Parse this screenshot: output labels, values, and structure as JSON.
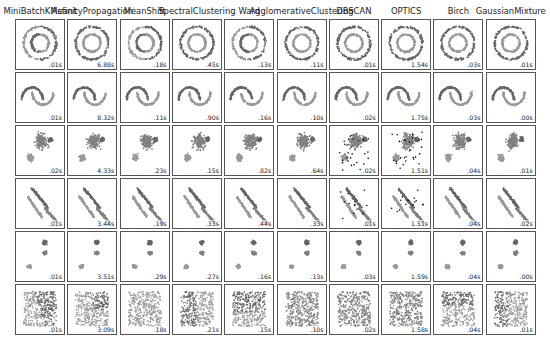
{
  "chart_data": {
    "type": "scatter",
    "layout": {
      "rows": 6,
      "cols": 10,
      "grid": false,
      "axes_ticks": false
    },
    "algorithms": [
      "MiniBatchKMeant",
      "AsfinityPropagation",
      "MeanShift",
      "SpectralClustering",
      "Ward",
      "AgglomerativeClustering",
      "DBSCAN",
      "OPTICS",
      "Birch",
      "GaussianMixture"
    ],
    "datasets": [
      "noisy_circles",
      "noisy_moons",
      "varied_blobs",
      "anisotropic_blobs",
      "blobs",
      "no_structure"
    ],
    "timings": [
      [
        ".01s",
        "6.88s",
        ".18s",
        ".45s",
        ".13s",
        ".11s",
        ".01s",
        "1.54s",
        ".03s",
        ".01s"
      ],
      [
        ".01s",
        "8.32s",
        ".11s",
        ".90s",
        ".16s",
        ".10s",
        ".02s",
        "1.75s",
        ".03s",
        ".00s"
      ],
      [
        ".02s",
        "4.33s",
        ".23s",
        ".15s",
        ".82s",
        ".64s",
        ".02s",
        "1.51s",
        ".04s",
        ".01s"
      ],
      [
        ".01s",
        "3.44s",
        ".19s",
        ".33s",
        ".44s",
        ".33s",
        ".01s",
        "1.51s",
        ".04s",
        ".02s"
      ],
      [
        ".01s",
        "3.51s",
        ".29s",
        ".27s",
        ".16s",
        ".13s",
        ".03s",
        "1.59s",
        ".04s",
        ".00s"
      ],
      [
        ".01s",
        "3.09s",
        ".18s",
        ".21s",
        ".15s",
        ".10s",
        ".02s",
        "1.58s",
        ".04s",
        ".01s"
      ]
    ],
    "palette": {
      "light": "#9a9a9a",
      "dark": "#666666",
      "mid": "#808080",
      "noise": "#000000"
    }
  }
}
